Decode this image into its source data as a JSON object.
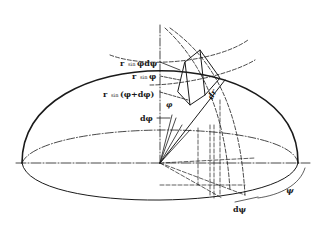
{
  "figure": {
    "colors": {
      "ink": "#1a1a1a",
      "background": "#ffffff"
    },
    "labels": {
      "r_sin_phi_dpsi": {
        "r": "r",
        "sin": "sin",
        "rest": "φdψ"
      },
      "r_sin_phi": {
        "r": "r",
        "sin": "sin",
        "rest": "φ"
      },
      "r_sin_phi_dphi": {
        "r": "r",
        "sin": "sin",
        "rest": "(φ+dφ)"
      },
      "phi": "φ",
      "dphi": "dφ",
      "dr": "dr",
      "psi": "ψ",
      "dpsi": "dψ"
    }
  }
}
